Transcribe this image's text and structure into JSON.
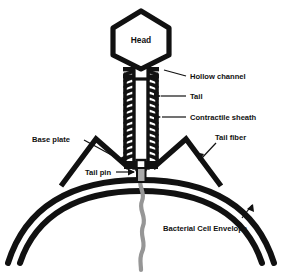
{
  "figure": {
    "background_color": "#ffffff",
    "stroke_color": "#111111",
    "dna_color": "#969696"
  },
  "labels": {
    "head": "Head",
    "hollow_channel": "Hollow channel",
    "tail": "Tail",
    "contractile_sheath": "Contractile sheath",
    "tail_fiber": "Tail fiber",
    "base_plate": "Base plate",
    "tail_pin": "Tail pin",
    "bacterial_cell_envelope": "Bacterial Cell Envelope"
  },
  "parts": {
    "head": {
      "shape": "hexagon",
      "label": "Head"
    },
    "neck": {
      "shape": "collar",
      "label": ""
    },
    "hollow_channel": {
      "shape": "vertical-tube",
      "label": "Hollow channel"
    },
    "contractile_sheath": {
      "shape": "helical-coil",
      "rings": 14,
      "label": "Contractile sheath"
    },
    "base_plate": {
      "shape": "bar",
      "label": "Base plate"
    },
    "tail_pin": {
      "shape": "pin",
      "label": "Tail pin"
    },
    "tail_fiber_left": {
      "shape": "bent-leg",
      "label": "Tail fiber"
    },
    "tail_fiber_right": {
      "shape": "bent-leg",
      "label": "Tail fiber"
    },
    "bacterial_cell_envelope": {
      "shape": "double-arc",
      "label": "Bacterial Cell Envelope"
    },
    "dna_strand": {
      "shape": "wavy-line",
      "label": ""
    }
  }
}
